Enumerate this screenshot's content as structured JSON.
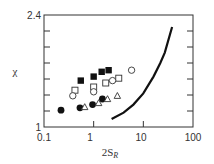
{
  "chart_data": {
    "type": "scatter",
    "title": "",
    "xlabel": "2S",
    "xlabel_subscript": "R",
    "ylabel": "χ",
    "xscale": "log",
    "xlim": [
      0.1,
      100
    ],
    "ylim": [
      1,
      2.4
    ],
    "x_ticks": [
      "0.1",
      "1",
      "10",
      "100"
    ],
    "y_ticks_labeled": [
      "1",
      "2.4"
    ],
    "y_tick_step": 0.2,
    "grid": false,
    "legend": null,
    "series": [
      {
        "name": "filled-squares",
        "marker": "square-filled",
        "points": [
          [
            0.55,
            1.58
          ],
          [
            1.0,
            1.63
          ],
          [
            1.45,
            1.69
          ],
          [
            2.0,
            1.71
          ]
        ]
      },
      {
        "name": "open-squares",
        "marker": "square-open",
        "points": [
          [
            0.42,
            1.46
          ],
          [
            1.0,
            1.5
          ],
          [
            1.75,
            1.55
          ],
          [
            3.2,
            1.61
          ]
        ]
      },
      {
        "name": "open-circles",
        "marker": "circle-open",
        "points": [
          [
            0.38,
            1.39
          ],
          [
            1.0,
            1.44
          ],
          [
            2.4,
            1.58
          ],
          [
            5.8,
            1.71
          ]
        ]
      },
      {
        "name": "filled-circles",
        "marker": "circle-filled",
        "points": [
          [
            0.22,
            1.21
          ],
          [
            0.53,
            1.24
          ],
          [
            0.95,
            1.28
          ],
          [
            1.5,
            1.35
          ]
        ]
      },
      {
        "name": "open-triangles",
        "marker": "triangle-open",
        "points": [
          [
            0.66,
            1.25
          ],
          [
            1.26,
            1.3
          ],
          [
            1.9,
            1.35
          ],
          [
            3.0,
            1.39
          ]
        ]
      },
      {
        "name": "theory-curve",
        "type": "line",
        "points": [
          [
            2.3,
            1.1
          ],
          [
            4.0,
            1.18
          ],
          [
            6.3,
            1.28
          ],
          [
            10,
            1.42
          ],
          [
            16,
            1.63
          ],
          [
            22,
            1.8
          ],
          [
            27,
            1.93
          ],
          [
            38,
            2.25
          ]
        ]
      }
    ]
  },
  "labels": {
    "x_tick_0": "0.1",
    "x_tick_1": "1",
    "x_tick_2": "10",
    "x_tick_3": "100",
    "y_tick_top": "2.4",
    "y_tick_bottom": "1",
    "xlabel_main": "2S",
    "xlabel_sub": "R",
    "ylabel": "χ"
  }
}
